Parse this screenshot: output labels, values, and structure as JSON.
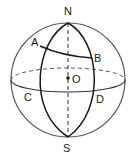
{
  "figure": {
    "type": "sphere-geometry",
    "labels": {
      "north": "N",
      "south": "S",
      "center": "O",
      "pointA": "A",
      "pointB": "B",
      "pointC": "C",
      "pointD": "D"
    },
    "colors": {
      "stroke": "#1a1a1a",
      "sphere_outline": "#555555",
      "background": "#ffffff"
    }
  }
}
